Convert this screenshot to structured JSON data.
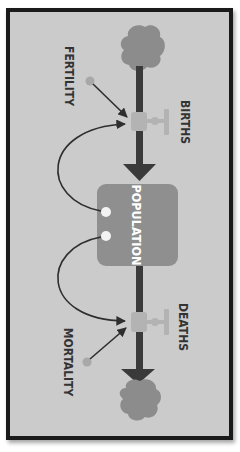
{
  "diagram": {
    "type": "stock-and-flow",
    "stock": {
      "label": "POPULATION"
    },
    "inflow": {
      "label": "BIRTHS"
    },
    "outflow": {
      "label": "DEATHS"
    },
    "converters": [
      {
        "label": "FERTILITY"
      },
      {
        "label": "MORTALITY"
      }
    ],
    "colors": {
      "background": "#cbcbcb",
      "frame": "#1a1a1a",
      "pipe": "#3a3a3a",
      "cloud": "#8c8c8c",
      "stock": "#8f8f8f",
      "valve": "#b3b3b3",
      "converter": "#a8a8a8",
      "text": "#333333",
      "stock_text": "#ffffff"
    }
  }
}
